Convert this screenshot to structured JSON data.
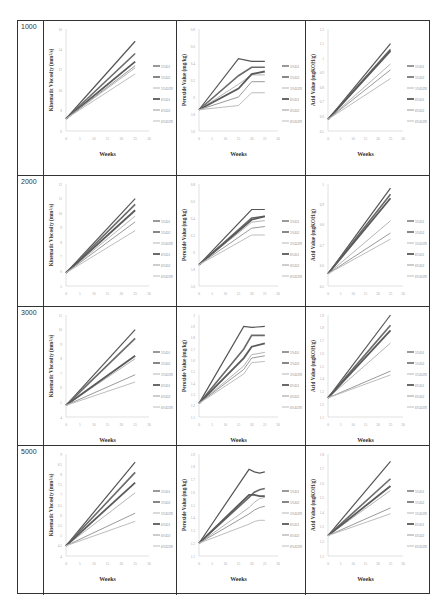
{
  "row_labels": [
    "1000",
    "2000",
    "3000",
    "5000"
  ],
  "legend": [
    "5%O1",
    "5%O2",
    "5%O3N",
    "6%O1",
    "6%O2",
    "6%O3N"
  ],
  "series_colors": [
    "#555555",
    "#6a6a6a",
    "#b5b5b5",
    "#5a5a5a",
    "#9a9a9a",
    "#bdbdbd"
  ],
  "series_widths": [
    1.2,
    1.6,
    1.0,
    1.8,
    1.0,
    1.0
  ],
  "xlabel": "Weeks",
  "chart_data": [
    {
      "type": "line",
      "row": "1000",
      "title": "",
      "xlabel": "Weeks",
      "ylabel": "Kinematic Viscosity (mm²/s)",
      "x": [
        0,
        25
      ],
      "xticks": [
        0,
        5,
        10,
        15,
        20,
        25,
        30
      ],
      "yticks": [
        6,
        8,
        10,
        12,
        14,
        16
      ],
      "ylim": [
        6,
        16
      ],
      "series": [
        {
          "name": "5%O1",
          "values": [
            7.2,
            14.8
          ]
        },
        {
          "name": "5%O2",
          "values": [
            7.2,
            13.6
          ]
        },
        {
          "name": "5%O3N",
          "values": [
            7.2,
            12.2
          ]
        },
        {
          "name": "6%O1",
          "values": [
            7.2,
            12.8
          ]
        },
        {
          "name": "6%O2",
          "values": [
            7.2,
            12.4
          ]
        },
        {
          "name": "6%O3N",
          "values": [
            7.2,
            11.6
          ]
        }
      ]
    },
    {
      "type": "line",
      "row": "1000",
      "xlabel": "Weeks",
      "ylabel": "Peroxide Value (mg/kg)",
      "x": [
        0,
        15,
        20,
        25
      ],
      "xticks": [
        0,
        5,
        10,
        15,
        20,
        25,
        30
      ],
      "yticks": [
        5.6,
        5.8,
        6,
        6.2,
        6.4,
        6.6,
        6.8
      ],
      "ylim": [
        5.6,
        6.8
      ],
      "series": [
        {
          "name": "5%O1",
          "values": [
            5.85,
            6.45,
            6.42,
            6.42
          ]
        },
        {
          "name": "5%O2",
          "values": [
            5.85,
            6.25,
            6.35,
            6.35
          ]
        },
        {
          "name": "5%O3N",
          "values": [
            5.85,
            6.15,
            6.26,
            6.26
          ]
        },
        {
          "name": "6%O1",
          "values": [
            5.85,
            6.1,
            6.27,
            6.3
          ]
        },
        {
          "name": "6%O2",
          "values": [
            5.85,
            6.0,
            6.18,
            6.18
          ]
        },
        {
          "name": "6%O3N",
          "values": [
            5.85,
            5.9,
            6.05,
            6.05
          ]
        }
      ]
    },
    {
      "type": "line",
      "row": "1000",
      "xlabel": "Weeks",
      "ylabel": "Acid Value (mgKOH/g)",
      "x": [
        0,
        25
      ],
      "xticks": [
        0,
        5,
        10,
        15,
        20,
        25,
        30
      ],
      "yticks": [
        0.5,
        0.6,
        0.7,
        0.8,
        0.9,
        1.0,
        1.1,
        1.2
      ],
      "ylim": [
        0.5,
        1.2
      ],
      "series": [
        {
          "name": "5%O1",
          "values": [
            0.58,
            1.1
          ]
        },
        {
          "name": "5%O2",
          "values": [
            0.58,
            1.06
          ]
        },
        {
          "name": "5%O3N",
          "values": [
            0.58,
            0.96
          ]
        },
        {
          "name": "6%O1",
          "values": [
            0.58,
            1.05
          ]
        },
        {
          "name": "6%O2",
          "values": [
            0.58,
            0.92
          ]
        },
        {
          "name": "6%O3N",
          "values": [
            0.58,
            0.86
          ]
        }
      ]
    },
    {
      "type": "line",
      "row": "2000",
      "xlabel": "Weeks",
      "ylabel": "Kinematic Viscosity (mm²/s)",
      "x": [
        0,
        25
      ],
      "xticks": [
        0,
        5,
        10,
        15,
        20,
        25,
        30
      ],
      "yticks": [
        5,
        6,
        7,
        8,
        9,
        10,
        11,
        12
      ],
      "ylim": [
        5,
        12
      ],
      "series": [
        {
          "name": "5%O1",
          "values": [
            5.9,
            11.0
          ]
        },
        {
          "name": "5%O2",
          "values": [
            5.9,
            10.6
          ]
        },
        {
          "name": "5%O3N",
          "values": [
            5.9,
            9.8
          ]
        },
        {
          "name": "6%O1",
          "values": [
            5.9,
            10.2
          ]
        },
        {
          "name": "6%O2",
          "values": [
            5.9,
            9.4
          ]
        },
        {
          "name": "6%O3N",
          "values": [
            5.9,
            8.8
          ]
        }
      ]
    },
    {
      "type": "line",
      "row": "2000",
      "xlabel": "Weeks",
      "ylabel": "Peroxide Value (mg/kg)",
      "x": [
        0,
        20,
        25
      ],
      "xticks": [
        0,
        5,
        10,
        15,
        20,
        25,
        30
      ],
      "yticks": [
        5.6,
        5.8,
        6,
        6.2,
        6.4,
        6.6,
        6.8
      ],
      "ylim": [
        5.6,
        6.8
      ],
      "series": [
        {
          "name": "5%O1",
          "values": [
            5.85,
            6.5,
            6.5
          ]
        },
        {
          "name": "5%O2",
          "values": [
            5.85,
            6.4,
            6.42
          ]
        },
        {
          "name": "5%O3N",
          "values": [
            5.85,
            6.35,
            6.37
          ]
        },
        {
          "name": "6%O1",
          "values": [
            5.85,
            6.38,
            6.42
          ]
        },
        {
          "name": "6%O2",
          "values": [
            5.85,
            6.28,
            6.3
          ]
        },
        {
          "name": "6%O3N",
          "values": [
            5.85,
            6.2,
            6.2
          ]
        }
      ]
    },
    {
      "type": "line",
      "row": "2000",
      "xlabel": "Weeks",
      "ylabel": "Acid Value (mgKOH/g)",
      "x": [
        0,
        25
      ],
      "xticks": [
        0,
        5,
        10,
        15,
        20,
        25,
        30
      ],
      "yticks": [
        0.5,
        0.6,
        0.7,
        0.8,
        0.9,
        1.0
      ],
      "ylim": [
        0.5,
        1.0
      ],
      "series": [
        {
          "name": "5%O1",
          "values": [
            0.56,
            0.98
          ]
        },
        {
          "name": "5%O2",
          "values": [
            0.56,
            0.95
          ]
        },
        {
          "name": "5%O3N",
          "values": [
            0.56,
            0.82
          ]
        },
        {
          "name": "6%O1",
          "values": [
            0.56,
            0.93
          ]
        },
        {
          "name": "6%O2",
          "values": [
            0.56,
            0.76
          ]
        },
        {
          "name": "6%O3N",
          "values": [
            0.56,
            0.73
          ]
        }
      ]
    },
    {
      "type": "line",
      "row": "3000",
      "xlabel": "Weeks",
      "ylabel": "Kinematic Viscosity (mm²/s)",
      "x": [
        0,
        25
      ],
      "xticks": [
        0,
        5,
        10,
        15,
        20,
        25,
        30
      ],
      "yticks": [
        4,
        5,
        6,
        7,
        8,
        9,
        10,
        11
      ],
      "ylim": [
        4,
        11
      ],
      "series": [
        {
          "name": "5%O1",
          "values": [
            4.8,
            10.0
          ]
        },
        {
          "name": "5%O2",
          "values": [
            4.8,
            9.4
          ]
        },
        {
          "name": "5%O3N",
          "values": [
            4.8,
            8.0
          ]
        },
        {
          "name": "6%O1",
          "values": [
            4.8,
            8.2
          ]
        },
        {
          "name": "6%O2",
          "values": [
            4.8,
            6.9
          ]
        },
        {
          "name": "6%O3N",
          "values": [
            4.8,
            6.4
          ]
        }
      ]
    },
    {
      "type": "line",
      "row": "3000",
      "xlabel": "Weeks",
      "ylabel": "Peroxide Value (mg/kg)",
      "x": [
        0,
        17,
        20,
        25
      ],
      "xticks": [
        0,
        5,
        10,
        15,
        20,
        25,
        30
      ],
      "yticks": [
        1.1,
        1.2,
        1.3,
        1.4,
        1.5,
        1.6,
        1.7,
        1.8,
        1.9,
        2.0
      ],
      "ylim": [
        1.1,
        2.0
      ],
      "series": [
        {
          "name": "5%O1",
          "values": [
            1.22,
            1.9,
            1.89,
            1.9
          ]
        },
        {
          "name": "5%O2",
          "values": [
            1.22,
            1.7,
            1.82,
            1.82
          ]
        },
        {
          "name": "5%O3N",
          "values": [
            1.22,
            1.55,
            1.65,
            1.67
          ]
        },
        {
          "name": "6%O1",
          "values": [
            1.22,
            1.62,
            1.72,
            1.75
          ]
        },
        {
          "name": "6%O2",
          "values": [
            1.22,
            1.52,
            1.62,
            1.64
          ]
        },
        {
          "name": "6%O3N",
          "values": [
            1.22,
            1.48,
            1.58,
            1.59
          ]
        }
      ]
    },
    {
      "type": "line",
      "row": "3000",
      "xlabel": "Weeks",
      "ylabel": "Acid Value (mgKOH/g)",
      "x": [
        0,
        25
      ],
      "xticks": [
        0,
        5,
        10,
        15,
        20,
        25,
        30
      ],
      "yticks": [
        1.1,
        1.2,
        1.3,
        1.4,
        1.5,
        1.6,
        1.7,
        1.8,
        1.9
      ],
      "ylim": [
        1.1,
        1.9
      ],
      "series": [
        {
          "name": "5%O1",
          "values": [
            1.25,
            1.9
          ]
        },
        {
          "name": "5%O2",
          "values": [
            1.25,
            1.82
          ]
        },
        {
          "name": "5%O3N",
          "values": [
            1.25,
            1.68
          ]
        },
        {
          "name": "6%O1",
          "values": [
            1.25,
            1.78
          ]
        },
        {
          "name": "6%O2",
          "values": [
            1.25,
            1.46
          ]
        },
        {
          "name": "6%O3N",
          "values": [
            1.25,
            1.43
          ]
        }
      ]
    },
    {
      "type": "line",
      "row": "5000",
      "xlabel": "Weeks",
      "ylabel": "Kinematic Viscosity (mm²/s)",
      "x": [
        0,
        25
      ],
      "xticks": [
        0,
        5,
        10,
        15,
        20,
        25,
        30
      ],
      "yticks": [
        4,
        4.5,
        5,
        5.5,
        6,
        6.5,
        7,
        7.5,
        8,
        8.5,
        9
      ],
      "ylim": [
        4,
        9
      ],
      "series": [
        {
          "name": "5%O1",
          "values": [
            4.5,
            8.6
          ]
        },
        {
          "name": "5%O2",
          "values": [
            4.5,
            8.1
          ]
        },
        {
          "name": "5%O3N",
          "values": [
            4.5,
            7.1
          ]
        },
        {
          "name": "6%O1",
          "values": [
            4.5,
            7.6
          ]
        },
        {
          "name": "6%O2",
          "values": [
            4.5,
            6.1
          ]
        },
        {
          "name": "6%O3N",
          "values": [
            4.5,
            5.7
          ]
        }
      ]
    },
    {
      "type": "line",
      "row": "5000",
      "xlabel": "Weeks",
      "ylabel": "Peroxide Value (mg/kg)",
      "x": [
        0,
        19,
        21,
        23,
        25
      ],
      "xticks": [
        0,
        5,
        10,
        15,
        20,
        25,
        30
      ],
      "yticks": [
        1.1,
        1.2,
        1.3,
        1.4,
        1.5,
        1.6,
        1.7,
        1.8,
        1.9
      ],
      "ylim": [
        1.1,
        1.9
      ],
      "series": [
        {
          "name": "5%O1",
          "values": [
            1.2,
            1.78,
            1.76,
            1.75,
            1.76
          ]
        },
        {
          "name": "5%O2",
          "values": [
            1.2,
            1.56,
            1.6,
            1.62,
            1.63
          ]
        },
        {
          "name": "5%O3N",
          "values": [
            1.2,
            1.48,
            1.52,
            1.55,
            1.56
          ]
        },
        {
          "name": "6%O1",
          "values": [
            1.2,
            1.58,
            1.58,
            1.57,
            1.57
          ]
        },
        {
          "name": "6%O2",
          "values": [
            1.2,
            1.43,
            1.46,
            1.48,
            1.49
          ]
        },
        {
          "name": "6%O3N",
          "values": [
            1.2,
            1.35,
            1.37,
            1.38,
            1.38
          ]
        }
      ]
    },
    {
      "type": "line",
      "row": "5000",
      "xlabel": "Weeks",
      "ylabel": "Acid Value (mgKOH/g)",
      "x": [
        0,
        25
      ],
      "xticks": [
        0,
        5,
        10,
        15,
        20,
        25,
        30
      ],
      "yticks": [
        1.1,
        1.2,
        1.3,
        1.4,
        1.5,
        1.6,
        1.7,
        1.8
      ],
      "ylim": [
        1.1,
        1.8
      ],
      "series": [
        {
          "name": "5%O1",
          "values": [
            1.24,
            1.75
          ]
        },
        {
          "name": "5%O2",
          "values": [
            1.24,
            1.63
          ]
        },
        {
          "name": "5%O3N",
          "values": [
            1.24,
            1.55
          ]
        },
        {
          "name": "6%O1",
          "values": [
            1.24,
            1.58
          ]
        },
        {
          "name": "6%O2",
          "values": [
            1.24,
            1.43
          ]
        },
        {
          "name": "6%O3N",
          "values": [
            1.24,
            1.39
          ]
        }
      ]
    }
  ]
}
